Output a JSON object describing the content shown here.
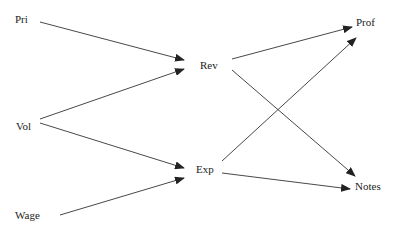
{
  "diagram": {
    "type": "directed-graph",
    "colors": {
      "edge": "#333333",
      "text": "#222222",
      "background": "#ffffff"
    },
    "nodes": [
      {
        "id": "Pri",
        "label": "Pri",
        "x": 15,
        "y": 13
      },
      {
        "id": "Vol",
        "label": "Vol",
        "x": 16,
        "y": 120
      },
      {
        "id": "Wage",
        "label": "Wage",
        "x": 15,
        "y": 209
      },
      {
        "id": "Rev",
        "label": "Rev",
        "x": 200,
        "y": 59
      },
      {
        "id": "Exp",
        "label": "Exp",
        "x": 196,
        "y": 163
      },
      {
        "id": "Prof",
        "label": "Prof",
        "x": 356,
        "y": 16
      },
      {
        "id": "Notes",
        "label": "Notes",
        "x": 355,
        "y": 180
      }
    ],
    "edges": [
      {
        "from": "Pri",
        "to": "Rev",
        "x1": 40,
        "y1": 22,
        "x2": 184,
        "y2": 60
      },
      {
        "from": "Vol",
        "to": "Rev",
        "x1": 40,
        "y1": 119,
        "x2": 184,
        "y2": 69
      },
      {
        "from": "Vol",
        "to": "Exp",
        "x1": 40,
        "y1": 123,
        "x2": 184,
        "y2": 168
      },
      {
        "from": "Wage",
        "to": "Exp",
        "x1": 60,
        "y1": 215,
        "x2": 184,
        "y2": 178
      },
      {
        "from": "Rev",
        "to": "Prof",
        "x1": 232,
        "y1": 59,
        "x2": 352,
        "y2": 27
      },
      {
        "from": "Rev",
        "to": "Notes",
        "x1": 232,
        "y1": 70,
        "x2": 355,
        "y2": 176
      },
      {
        "from": "Exp",
        "to": "Prof",
        "x1": 222,
        "y1": 161,
        "x2": 356,
        "y2": 38
      },
      {
        "from": "Exp",
        "to": "Notes",
        "x1": 222,
        "y1": 173,
        "x2": 350,
        "y2": 189
      }
    ]
  }
}
